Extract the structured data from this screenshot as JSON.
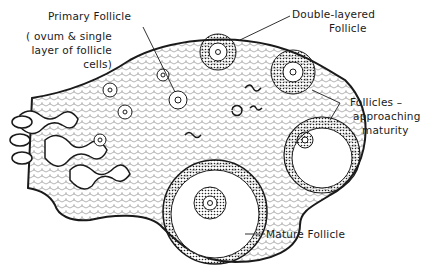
{
  "diagram": {
    "labels": {
      "primary_follicle": "Primary Follicle",
      "primary_note_line1": "( ovum & single",
      "primary_note_line2": "layer of follicle",
      "primary_note_line3": "cells)",
      "double_layered_line1": "Double-layered",
      "double_layered_line2": "Follicle",
      "approaching_line1": "Follicles –",
      "approaching_line2": "approaching",
      "approaching_line3": "maturity",
      "mature_follicle": "Mature Follicle"
    },
    "colors": {
      "ink": "#1a1a1a",
      "background": "#ffffff",
      "stipple": "#555555"
    }
  }
}
